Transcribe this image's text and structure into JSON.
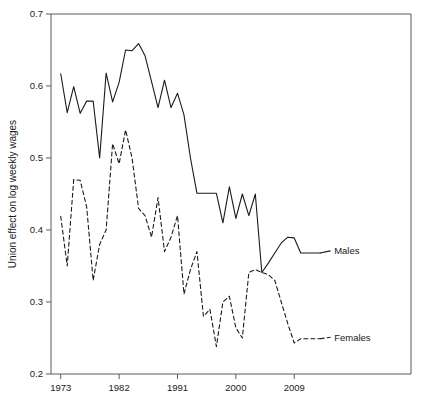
{
  "chart_data": {
    "type": "line",
    "title": "",
    "xlabel": "",
    "ylabel": "Union effect on log weekly wages",
    "xlim": [
      1971.5,
      2027
    ],
    "ylim": [
      0.2,
      0.7
    ],
    "grid": false,
    "legend_position": "inline-right-of-line-ends",
    "xticks": [
      1973,
      1982,
      1991,
      2000,
      2009
    ],
    "xticklabels": [
      "1973",
      "1982",
      "1991",
      "2000",
      "2009"
    ],
    "yticks": [
      0.2,
      0.3,
      0.4,
      0.5,
      0.6,
      0.7
    ],
    "yticklabels": [
      "0.2",
      "0.3",
      "0.4",
      "0.5",
      "0.6",
      "0.7"
    ],
    "series": [
      {
        "name": "Males",
        "label": "Males",
        "linestyle": "solid",
        "color": "#1a1a1a",
        "x": [
          1973,
          1974,
          1975,
          1976,
          1977,
          1978,
          1979,
          1980,
          1981,
          1982,
          1983,
          1984,
          1985,
          1986,
          1987,
          1988,
          1989,
          1990,
          1991,
          1992,
          1993,
          1994,
          1995,
          1996,
          1997,
          1998,
          1999,
          2000,
          2001,
          2002,
          2003,
          2004,
          2005,
          2006,
          2007,
          2008,
          2009,
          2010,
          2011,
          2012,
          2013
        ],
        "values": [
          0.617,
          0.563,
          0.599,
          0.562,
          0.579,
          0.579,
          0.5,
          0.618,
          0.578,
          0.605,
          0.65,
          0.649,
          0.659,
          0.642,
          0.606,
          0.57,
          0.608,
          0.57,
          0.59,
          0.56,
          0.5,
          0.451,
          0.451,
          0.451,
          0.451,
          0.41,
          0.46,
          0.416,
          0.45,
          0.42,
          0.45,
          0.341,
          0.354,
          0.368,
          0.382,
          0.39,
          0.389,
          0.368,
          0.368,
          0.368,
          0.368
        ]
      },
      {
        "name": "Females",
        "label": "Females",
        "linestyle": "dashed",
        "color": "#1a1a1a",
        "x": [
          1973,
          1974,
          1975,
          1976,
          1977,
          1978,
          1979,
          1980,
          1981,
          1982,
          1983,
          1984,
          1985,
          1986,
          1987,
          1988,
          1989,
          1990,
          1991,
          1992,
          1993,
          1994,
          1995,
          1996,
          1997,
          1998,
          1999,
          2000,
          2001,
          2002,
          2003,
          2004,
          2005,
          2006,
          2007,
          2008,
          2009,
          2010,
          2011,
          2012,
          2013
        ],
        "values": [
          0.419,
          0.35,
          0.47,
          0.469,
          0.432,
          0.33,
          0.38,
          0.4,
          0.52,
          0.492,
          0.539,
          0.5,
          0.43,
          0.42,
          0.39,
          0.445,
          0.37,
          0.39,
          0.42,
          0.311,
          0.345,
          0.37,
          0.28,
          0.29,
          0.238,
          0.3,
          0.308,
          0.264,
          0.25,
          0.341,
          0.345,
          0.341,
          0.338,
          0.33,
          0.3,
          0.27,
          0.243,
          0.249,
          0.249,
          0.249,
          0.249
        ]
      }
    ],
    "annotations": [
      {
        "name": "males-label",
        "text": "Males",
        "x": 2015,
        "y": 0.371
      },
      {
        "name": "females-label",
        "text": "Females",
        "x": 2015,
        "y": 0.251
      }
    ]
  },
  "axis": {
    "ylabel": "Union effect on log weekly wages"
  }
}
